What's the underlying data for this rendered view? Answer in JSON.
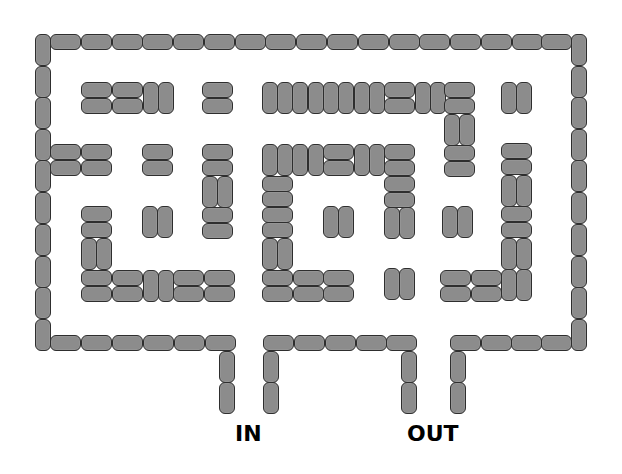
{
  "colors": {
    "brick_fill": "#8c8c8c",
    "brick_outline": "#2e2e2e",
    "background": "#ffffff",
    "label": "#000000"
  },
  "labels": [
    {
      "id": "entrance",
      "text": "IN",
      "x": 235,
      "y": 423
    },
    {
      "id": "exit",
      "text": "OUT",
      "x": 407,
      "y": 423
    }
  ],
  "brick_size": {
    "h": [
      31,
      16
    ],
    "v": [
      16,
      32
    ]
  },
  "bricks": {
    "outer_left_wall": [
      [
        "v",
        35,
        34
      ],
      [
        "v",
        35,
        66
      ],
      [
        "v",
        35,
        97
      ],
      [
        "v",
        35,
        129
      ],
      [
        "v",
        35,
        160
      ],
      [
        "v",
        35,
        192
      ],
      [
        "v",
        35,
        224
      ],
      [
        "v",
        35,
        256
      ],
      [
        "v",
        35,
        287
      ],
      [
        "v",
        35,
        319
      ]
    ],
    "outer_top_wall": [
      [
        "h",
        50,
        34
      ],
      [
        "h",
        81,
        34
      ],
      [
        "h",
        112,
        34
      ],
      [
        "h",
        142,
        34
      ],
      [
        "h",
        173,
        34
      ],
      [
        "h",
        204,
        34
      ],
      [
        "h",
        235,
        34
      ],
      [
        "h",
        265,
        34
      ],
      [
        "h",
        296,
        34
      ],
      [
        "h",
        327,
        34
      ],
      [
        "h",
        358,
        34
      ],
      [
        "h",
        389,
        34
      ],
      [
        "h",
        419,
        34
      ],
      [
        "h",
        450,
        34
      ],
      [
        "h",
        481,
        34
      ],
      [
        "h",
        512,
        34
      ],
      [
        "h",
        541,
        34
      ]
    ],
    "outer_right_wall": [
      [
        "v",
        571,
        34
      ],
      [
        "v",
        571,
        66
      ],
      [
        "v",
        571,
        97
      ],
      [
        "v",
        571,
        129
      ],
      [
        "v",
        571,
        160
      ],
      [
        "v",
        571,
        192
      ],
      [
        "v",
        571,
        224
      ],
      [
        "v",
        571,
        256
      ],
      [
        "v",
        571,
        287
      ],
      [
        "v",
        571,
        319
      ]
    ],
    "outer_bottom_wall": [
      [
        "h",
        50,
        335
      ],
      [
        "h",
        81,
        335
      ],
      [
        "h",
        112,
        335
      ],
      [
        "h",
        143,
        335
      ],
      [
        "h",
        174,
        335
      ],
      [
        "h",
        205,
        335
      ],
      [
        "h",
        263,
        335
      ],
      [
        "h",
        294,
        335
      ],
      [
        "h",
        325,
        335
      ],
      [
        "h",
        356,
        335
      ],
      [
        "h",
        386,
        335
      ],
      [
        "h",
        450,
        335
      ],
      [
        "h",
        481,
        335
      ],
      [
        "h",
        511,
        335
      ],
      [
        "h",
        541,
        335
      ]
    ],
    "entrance_stubs": [
      [
        "v",
        219,
        351
      ],
      [
        "v",
        219,
        382
      ],
      [
        "v",
        263,
        351
      ],
      [
        "v",
        263,
        382
      ]
    ],
    "exit_stubs": [
      [
        "v",
        401,
        351
      ],
      [
        "v",
        401,
        382
      ],
      [
        "v",
        450,
        351
      ],
      [
        "v",
        450,
        382
      ]
    ],
    "interior": [
      [
        "h",
        81,
        82
      ],
      [
        "h",
        112,
        82
      ],
      [
        "h",
        81,
        98
      ],
      [
        "h",
        112,
        98
      ],
      [
        "v",
        143,
        82
      ],
      [
        "v",
        158,
        82
      ],
      [
        "h",
        202,
        82
      ],
      [
        "h",
        202,
        98
      ],
      [
        "v",
        262,
        82
      ],
      [
        "v",
        277,
        82
      ],
      [
        "v",
        292,
        82
      ],
      [
        "v",
        308,
        82
      ],
      [
        "v",
        323,
        82
      ],
      [
        "v",
        338,
        82
      ],
      [
        "v",
        354,
        82
      ],
      [
        "v",
        369,
        82
      ],
      [
        "h",
        384,
        82
      ],
      [
        "h",
        384,
        98
      ],
      [
        "v",
        415,
        82
      ],
      [
        "v",
        430,
        82
      ],
      [
        "h",
        444,
        82
      ],
      [
        "h",
        444,
        98
      ],
      [
        "v",
        444,
        114
      ],
      [
        "v",
        459,
        114
      ],
      [
        "h",
        444,
        145
      ],
      [
        "h",
        444,
        161
      ],
      [
        "v",
        501,
        82
      ],
      [
        "v",
        516,
        82
      ],
      [
        "h",
        50,
        144
      ],
      [
        "h",
        81,
        144
      ],
      [
        "h",
        50,
        160
      ],
      [
        "h",
        81,
        160
      ],
      [
        "h",
        142,
        144
      ],
      [
        "h",
        142,
        160
      ],
      [
        "h",
        202,
        144
      ],
      [
        "h",
        202,
        160
      ],
      [
        "v",
        202,
        176
      ],
      [
        "v",
        217,
        176
      ],
      [
        "h",
        202,
        207
      ],
      [
        "h",
        202,
        223
      ],
      [
        "h",
        81,
        206
      ],
      [
        "h",
        81,
        222
      ],
      [
        "v",
        81,
        238
      ],
      [
        "v",
        96,
        238
      ],
      [
        "h",
        81,
        270
      ],
      [
        "h",
        112,
        270
      ],
      [
        "v",
        143,
        270
      ],
      [
        "v",
        158,
        270
      ],
      [
        "h",
        173,
        270
      ],
      [
        "h",
        204,
        270
      ],
      [
        "h",
        81,
        286
      ],
      [
        "h",
        112,
        286
      ],
      [
        "h",
        173,
        286
      ],
      [
        "h",
        204,
        286
      ],
      [
        "v",
        142,
        206
      ],
      [
        "v",
        157,
        206
      ],
      [
        "v",
        262,
        144
      ],
      [
        "v",
        277,
        144
      ],
      [
        "v",
        292,
        144
      ],
      [
        "v",
        308,
        144
      ],
      [
        "h",
        323,
        144
      ],
      [
        "h",
        323,
        160
      ],
      [
        "v",
        354,
        144
      ],
      [
        "v",
        369,
        144
      ],
      [
        "h",
        384,
        144
      ],
      [
        "h",
        384,
        160
      ],
      [
        "h",
        384,
        176
      ],
      [
        "h",
        384,
        192
      ],
      [
        "v",
        384,
        207
      ],
      [
        "v",
        399,
        207
      ],
      [
        "h",
        262,
        176
      ],
      [
        "h",
        262,
        191
      ],
      [
        "h",
        262,
        207
      ],
      [
        "h",
        262,
        222
      ],
      [
        "v",
        262,
        238
      ],
      [
        "v",
        277,
        238
      ],
      [
        "h",
        262,
        270
      ],
      [
        "h",
        293,
        270
      ],
      [
        "h",
        323,
        270
      ],
      [
        "h",
        262,
        286
      ],
      [
        "h",
        293,
        286
      ],
      [
        "h",
        323,
        286
      ],
      [
        "v",
        323,
        206
      ],
      [
        "v",
        338,
        206
      ],
      [
        "v",
        384,
        268
      ],
      [
        "v",
        399,
        268
      ],
      [
        "v",
        442,
        206
      ],
      [
        "v",
        457,
        206
      ],
      [
        "h",
        440,
        270
      ],
      [
        "h",
        471,
        270
      ],
      [
        "h",
        440,
        286
      ],
      [
        "h",
        471,
        286
      ],
      [
        "h",
        501,
        143
      ],
      [
        "h",
        501,
        159
      ],
      [
        "v",
        501,
        175
      ],
      [
        "v",
        516,
        175
      ],
      [
        "h",
        501,
        206
      ],
      [
        "h",
        501,
        222
      ],
      [
        "v",
        501,
        238
      ],
      [
        "v",
        516,
        238
      ],
      [
        "v",
        501,
        269
      ],
      [
        "v",
        516,
        269
      ]
    ]
  }
}
